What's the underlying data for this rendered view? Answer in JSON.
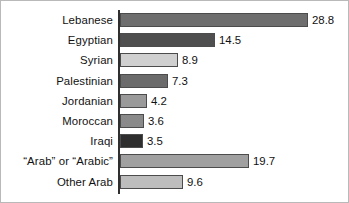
{
  "chart_data": {
    "type": "bar",
    "orientation": "horizontal",
    "title": "",
    "subtitle": "",
    "xlabel": "",
    "ylabel": "",
    "grid": false,
    "legend": null,
    "axis_line": true,
    "xlim": [
      0,
      28.8
    ],
    "value_label_format": "one-decimal",
    "categories": [
      "Lebanese",
      "Egyptian",
      "Syrian",
      "Palestinian",
      "Jordanian",
      "Moroccan",
      "Iraqi",
      "“Arab” or “Arabic”",
      "Other Arab"
    ],
    "values": [
      28.8,
      14.5,
      8.9,
      7.3,
      4.2,
      3.6,
      3.5,
      19.7,
      9.6
    ],
    "value_labels": [
      "28.8",
      "14.5",
      "8.9",
      "7.3",
      "4.2",
      "3.6",
      "3.5",
      "19.7",
      "9.6"
    ],
    "bar_fills": [
      "#6e6e6e",
      "#4f4f4f",
      "#d0d0d0",
      "#6b6b6b",
      "#9a9a9a",
      "#8a8a8a",
      "#2e2e2e",
      "#a0a0a0",
      "#bdbdbd"
    ],
    "bar_outline": "#4c4c4c",
    "axis_color": "#2f2f2f",
    "text_color": "#111111",
    "background": "#ffffff",
    "border_color": "#b9b9b9",
    "px_per_unit": 6.53
  }
}
